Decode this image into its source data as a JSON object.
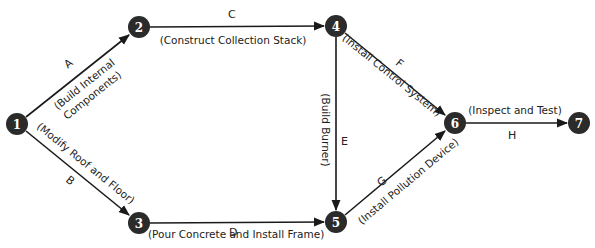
{
  "diagram": {
    "type": "activity-on-arrow network",
    "colors": {
      "node_fill": "#2b2b2b",
      "node_text": "#ffffff",
      "edge": "#1a1a1a",
      "text": "#222222"
    },
    "nodes": [
      {
        "id": "1",
        "label": "1",
        "x": 17,
        "y": 124
      },
      {
        "id": "2",
        "label": "2",
        "x": 139,
        "y": 27
      },
      {
        "id": "3",
        "label": "3",
        "x": 139,
        "y": 223
      },
      {
        "id": "4",
        "label": "4",
        "x": 336,
        "y": 26
      },
      {
        "id": "5",
        "label": "5",
        "x": 336,
        "y": 222
      },
      {
        "id": "6",
        "label": "6",
        "x": 455,
        "y": 123
      },
      {
        "id": "7",
        "label": "7",
        "x": 579,
        "y": 123
      }
    ],
    "edges": [
      {
        "letter": "A",
        "from": "1",
        "to": "2",
        "activity": "(Build Internal",
        "activity_line2": "Components)"
      },
      {
        "letter": "B",
        "from": "1",
        "to": "3",
        "activity": "(Modify Roof and Floor)"
      },
      {
        "letter": "C",
        "from": "2",
        "to": "4",
        "activity": "(Construct Collection Stack)"
      },
      {
        "letter": "D",
        "from": "3",
        "to": "5",
        "activity": "(Pour Concrete and Install Frame)"
      },
      {
        "letter": "E",
        "from": "4",
        "to": "5",
        "activity": "(Build Burner)"
      },
      {
        "letter": "F",
        "from": "4",
        "to": "6",
        "activity": "(Install Control System)"
      },
      {
        "letter": "G",
        "from": "5",
        "to": "6",
        "activity": "(Install Pollution Device)"
      },
      {
        "letter": "H",
        "from": "6",
        "to": "7",
        "activity": "(Inspect and Test)"
      }
    ]
  }
}
